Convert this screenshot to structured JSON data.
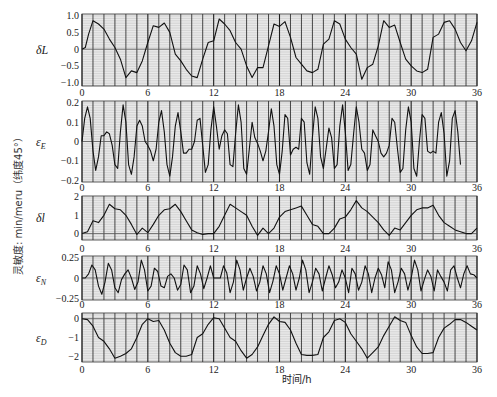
{
  "figure": {
    "x_axis_label": "时间/h",
    "side_label": "灵敏度: min/meru（纬度45°）",
    "colors": {
      "background": "#ffffff",
      "plot_bg": "#e9e9e9",
      "hgrid": "#c4c4c4",
      "vgrid": "#1e1e1e",
      "line": "#111111",
      "frame": "#333333"
    }
  },
  "chart_data": [
    {
      "id": "dL",
      "type": "line",
      "ylabel": "δL",
      "ylabel_sub": "",
      "xlim": [
        0,
        36
      ],
      "ylim": [
        -1.1,
        1.05
      ],
      "yticks": [
        1.0,
        0.5,
        0,
        -0.5,
        -1.0
      ],
      "ytick_labels": [
        "1.0",
        "0.5",
        "0",
        "-0.5",
        "-1.0"
      ],
      "xticks": [
        0,
        6,
        12,
        18,
        24,
        30,
        36
      ],
      "xtick_labels": [
        "0",
        "6",
        "12",
        "18",
        "24",
        "30",
        "36"
      ],
      "x": [
        0,
        0.3,
        0.6,
        1.0,
        1.5,
        2.0,
        2.5,
        3.0,
        3.5,
        4.0,
        4.5,
        5.0,
        5.5,
        6.0,
        6.5,
        7.0,
        7.5,
        8.0,
        8.5,
        9.0,
        9.5,
        10.0,
        10.5,
        11.0,
        11.5,
        12.0,
        12.5,
        13.0,
        13.5,
        14.0,
        14.5,
        15.0,
        15.5,
        16.0,
        16.5,
        17.0,
        17.5,
        18.0,
        18.5,
        19.0,
        19.5,
        20.0,
        20.5,
        21.0,
        21.5,
        22.0,
        22.5,
        23.0,
        23.5,
        24.0,
        24.5,
        25.0,
        25.5,
        26.0,
        26.5,
        27.0,
        27.5,
        28.0,
        28.5,
        29.0,
        29.5,
        30.0,
        30.5,
        31.0,
        31.5,
        32.0,
        32.5,
        33.0,
        33.5,
        34.0,
        34.5,
        35.0,
        35.5,
        36.0
      ],
      "y": [
        0,
        0.05,
        0.45,
        0.85,
        0.75,
        0.6,
        0.3,
        0.05,
        -0.3,
        -0.85,
        -0.65,
        -0.7,
        -0.35,
        0.2,
        0.7,
        0.65,
        0.78,
        0.5,
        -0.15,
        -0.35,
        -0.6,
        -0.8,
        -0.85,
        -0.3,
        0.2,
        0.25,
        0.9,
        0.75,
        0.55,
        0.2,
        0.0,
        -0.5,
        -0.85,
        -0.55,
        -0.55,
        0.1,
        0.75,
        0.68,
        0.82,
        0.35,
        -0.25,
        -0.45,
        -0.65,
        -0.7,
        -0.6,
        0.15,
        0.3,
        0.85,
        0.75,
        0.3,
        0.05,
        -0.15,
        -0.9,
        -0.55,
        -0.45,
        0.1,
        0.85,
        0.65,
        0.72,
        0.2,
        -0.3,
        -0.5,
        -0.65,
        -0.7,
        -0.6,
        0.35,
        0.45,
        0.8,
        0.85,
        0.6,
        0.2,
        -0.05,
        0.25,
        0.8
      ]
    },
    {
      "id": "eE",
      "type": "line",
      "ylabel": "ε",
      "ylabel_sub": "E",
      "xlim": [
        0,
        36
      ],
      "ylim": [
        -0.21,
        0.21
      ],
      "yticks": [
        0.2,
        0.1,
        0,
        -0.1,
        -0.2
      ],
      "ytick_labels": [
        "0.2",
        "0.1",
        "0",
        "-0.1",
        "-0.2"
      ],
      "xticks": [
        0,
        6,
        12,
        18,
        24,
        30,
        36
      ],
      "xtick_labels": [
        "0",
        "6",
        "12",
        "18",
        "24",
        "30",
        "36"
      ],
      "x": [
        0,
        0.25,
        0.5,
        0.75,
        1.0,
        1.25,
        1.5,
        1.75,
        2.0,
        2.25,
        2.5,
        2.75,
        3.0,
        3.25,
        3.5,
        3.75,
        4.0,
        4.25,
        4.5,
        4.75,
        5.0,
        5.25,
        5.5,
        5.75,
        6.0,
        6.25,
        6.5,
        6.75,
        7.0,
        7.25,
        7.5,
        7.75,
        8.0,
        8.25,
        8.5,
        8.75,
        9.0,
        9.25,
        9.5,
        9.75,
        10.0,
        10.25,
        10.5,
        10.75,
        11.0,
        11.25,
        11.5,
        11.75,
        12.0,
        12.25,
        12.5,
        12.75,
        13.0,
        13.25,
        13.5,
        13.75,
        14.0,
        14.25,
        14.5,
        14.75,
        15.0,
        15.25,
        15.5,
        15.75,
        16.0,
        16.25,
        16.5,
        16.75,
        17.0,
        17.25,
        17.5,
        17.75,
        18.0,
        18.25,
        18.5,
        18.75,
        19.0,
        19.25,
        19.5,
        19.75,
        20.0,
        20.25,
        20.5,
        20.75,
        21.0,
        21.25,
        21.5,
        21.75,
        22.0,
        22.25,
        22.5,
        22.75,
        23.0,
        23.25,
        23.5,
        23.75,
        24.0,
        24.25,
        24.5,
        24.75,
        25.0,
        25.25,
        25.5,
        25.75,
        26.0,
        26.25,
        26.5,
        26.75,
        27.0,
        27.25,
        27.5,
        27.75,
        28.0,
        28.25,
        28.5,
        28.75,
        29.0,
        29.25,
        29.5,
        29.75,
        30.0,
        30.25,
        30.5,
        30.75,
        31.0,
        31.25,
        31.5,
        31.75,
        32.0,
        32.25,
        32.5,
        32.75,
        33.0,
        33.25,
        33.5,
        33.75,
        34.0,
        34.25,
        34.5,
        34.75,
        35.0,
        35.25,
        35.5,
        35.75,
        36.0
      ],
      "y": [
        0,
        0.12,
        0.18,
        0.12,
        -0.05,
        -0.15,
        -0.08,
        0.03,
        0.03,
        0.05,
        0.04,
        -0.02,
        -0.12,
        -0.14,
        0.05,
        0.19,
        0.1,
        -0.12,
        -0.17,
        -0.08,
        0.08,
        0.11,
        0.08,
        0.0,
        -0.02,
        -0.05,
        -0.1,
        -0.04,
        0.1,
        0.16,
        0.05,
        -0.12,
        -0.18,
        -0.08,
        0.08,
        0.15,
        0.05,
        -0.06,
        -0.06,
        -0.04,
        -0.04,
        0.0,
        0.11,
        0.12,
        -0.02,
        -0.16,
        -0.12,
        0.06,
        0.18,
        0.08,
        -0.04,
        0.03,
        0.06,
        0.04,
        -0.12,
        -0.13,
        0.04,
        0.19,
        0.1,
        -0.14,
        -0.17,
        -0.04,
        0.1,
        0.02,
        -0.01,
        -0.05,
        -0.1,
        -0.05,
        0.05,
        0.17,
        0.08,
        -0.12,
        -0.17,
        -0.05,
        0.14,
        0.12,
        -0.07,
        -0.04,
        -0.03,
        -0.04,
        0.12,
        0.1,
        -0.11,
        -0.17,
        0.02,
        0.18,
        0.12,
        -0.08,
        -0.14,
        -0.04,
        0.07,
        0.02,
        -0.14,
        -0.12,
        0.08,
        0.19,
        0.05,
        -0.15,
        -0.12,
        0.04,
        0.18,
        0.1,
        -0.04,
        -0.06,
        -0.15,
        -0.12,
        0.06,
        0.03,
        0.0,
        -0.06,
        -0.08,
        -0.06,
        -0.02,
        0.12,
        0.1,
        -0.04,
        -0.16,
        -0.14,
        0.06,
        0.18,
        0.1,
        -0.14,
        -0.18,
        0.0,
        0.14,
        0.12,
        -0.05,
        -0.06,
        -0.05,
        -0.06,
        0.1,
        0.15,
        0.04,
        -0.18,
        -0.1,
        0.12,
        0.16,
        0.05,
        -0.12
      ]
    },
    {
      "id": "dl",
      "type": "line",
      "ylabel": "δl",
      "ylabel_sub": "",
      "xlim": [
        0,
        36
      ],
      "ylim": [
        -0.35,
        2.05
      ],
      "yticks": [
        2,
        1,
        0
      ],
      "ytick_labels": [
        "2",
        "1",
        "0"
      ],
      "xticks": [
        0,
        6,
        12,
        18,
        24,
        30,
        36
      ],
      "xtick_labels": [
        "0",
        "6",
        "12",
        "18",
        "24",
        "30",
        "36"
      ],
      "x": [
        0,
        0.5,
        1.0,
        1.5,
        2.0,
        2.5,
        3.0,
        3.5,
        4.0,
        4.5,
        5.0,
        5.5,
        6.0,
        6.5,
        7.0,
        7.5,
        8.0,
        8.5,
        9.0,
        9.5,
        10.0,
        10.5,
        11.0,
        11.5,
        12.0,
        12.5,
        13.0,
        13.5,
        14.0,
        14.5,
        15.0,
        15.5,
        16.0,
        16.5,
        17.0,
        17.5,
        18.0,
        18.5,
        19.0,
        19.5,
        20.0,
        20.5,
        21.0,
        21.5,
        22.0,
        22.5,
        23.0,
        23.5,
        24.0,
        24.5,
        25.0,
        25.5,
        26.0,
        26.5,
        27.0,
        27.5,
        28.0,
        28.5,
        29.0,
        29.5,
        30.0,
        30.5,
        31.0,
        31.5,
        32.0,
        32.5,
        33.0,
        33.5,
        34.0,
        34.5,
        35.0,
        35.5,
        36.0
      ],
      "y": [
        0,
        0.1,
        0.7,
        0.6,
        1.0,
        1.6,
        1.35,
        1.3,
        1.0,
        0.5,
        -0.05,
        0.3,
        0.05,
        0.5,
        1.0,
        1.3,
        1.35,
        1.6,
        1.2,
        0.7,
        0.2,
        0.05,
        -0.05,
        0.0,
        0.0,
        0.4,
        1.0,
        1.6,
        1.4,
        1.2,
        1.0,
        0.4,
        -0.1,
        0.3,
        0.0,
        0.3,
        0.9,
        1.2,
        1.3,
        1.4,
        1.5,
        1.0,
        0.5,
        0.4,
        0.0,
        0.0,
        0.3,
        0.8,
        0.9,
        1.3,
        1.8,
        1.4,
        1.2,
        0.9,
        0.6,
        0.2,
        -0.1,
        0.3,
        0.2,
        0.6,
        1.0,
        1.3,
        1.4,
        1.4,
        1.55,
        1.0,
        0.6,
        0.4,
        0.2,
        0.1,
        0.0,
        0.0,
        0.3
      ]
    },
    {
      "id": "eN",
      "type": "line",
      "ylabel": "ε",
      "ylabel_sub": "N",
      "xlim": [
        0,
        36
      ],
      "ylim": [
        -0.27,
        0.27
      ],
      "yticks": [
        0.25,
        0,
        -0.25
      ],
      "ytick_labels": [
        "0.25",
        "0",
        "-0.25"
      ],
      "xticks": [
        0,
        6,
        12,
        18,
        24,
        30,
        36
      ],
      "xtick_labels": [
        "0",
        "6",
        "12",
        "18",
        "24",
        "30",
        "36"
      ],
      "x": [
        0,
        0.3,
        0.6,
        0.9,
        1.2,
        1.5,
        1.8,
        2.1,
        2.4,
        2.7,
        3.0,
        3.3,
        3.6,
        3.9,
        4.2,
        4.5,
        4.8,
        5.1,
        5.4,
        5.7,
        6.0,
        6.3,
        6.6,
        6.9,
        7.2,
        7.5,
        7.8,
        8.1,
        8.4,
        8.7,
        9.0,
        9.3,
        9.6,
        9.9,
        10.2,
        10.5,
        10.8,
        11.1,
        11.4,
        11.7,
        12.0,
        12.3,
        12.6,
        12.9,
        13.2,
        13.5,
        13.8,
        14.1,
        14.4,
        14.7,
        15.0,
        15.3,
        15.6,
        15.9,
        16.2,
        16.5,
        16.8,
        17.1,
        17.4,
        17.7,
        18.0,
        18.3,
        18.6,
        18.9,
        19.2,
        19.5,
        19.8,
        20.1,
        20.4,
        20.7,
        21.0,
        21.3,
        21.6,
        21.9,
        22.2,
        22.5,
        22.8,
        23.1,
        23.4,
        23.7,
        24.0,
        24.3,
        24.6,
        24.9,
        25.2,
        25.5,
        25.8,
        26.1,
        26.4,
        26.7,
        27.0,
        27.3,
        27.6,
        27.9,
        28.2,
        28.5,
        28.8,
        29.1,
        29.4,
        29.7,
        30.0,
        30.3,
        30.6,
        30.9,
        31.2,
        31.5,
        31.8,
        32.1,
        32.4,
        32.7,
        33.0,
        33.3,
        33.6,
        33.9,
        34.2,
        34.5,
        34.8,
        35.1,
        35.4,
        35.7,
        36.0
      ],
      "y": [
        0,
        0.0,
        0.05,
        0.16,
        0.1,
        -0.1,
        -0.2,
        -0.05,
        0.18,
        0.1,
        -0.12,
        -0.18,
        -0.02,
        0.05,
        0.1,
        0.0,
        -0.14,
        -0.05,
        0.22,
        0.1,
        -0.16,
        -0.1,
        0.12,
        0.08,
        -0.1,
        -0.12,
        0.02,
        0.05,
        0.0,
        -0.15,
        -0.08,
        0.16,
        0.1,
        -0.18,
        -0.1,
        0.15,
        0.05,
        -0.13,
        0.0,
        0.15,
        0.0,
        0.0,
        0.0,
        0.15,
        0.06,
        -0.18,
        -0.05,
        0.22,
        0.1,
        -0.15,
        0.0,
        0.12,
        0.02,
        -0.16,
        -0.05,
        0.15,
        0.05,
        -0.18,
        -0.04,
        0.15,
        0.05,
        -0.15,
        0.0,
        0.15,
        0.05,
        -0.15,
        0.0,
        0.22,
        0.1,
        -0.18,
        -0.05,
        0.12,
        0.05,
        -0.16,
        0.0,
        0.15,
        0.04,
        -0.12,
        -0.05,
        0.1,
        0.0,
        -0.18,
        0.12,
        0.05,
        -0.15,
        -0.05,
        0.15,
        0.05,
        -0.18,
        0.0,
        0.12,
        0.04,
        -0.12,
        0.2,
        0.1,
        -0.18,
        -0.05,
        0.12,
        0.05,
        -0.15,
        0.0,
        0.22,
        0.1,
        -0.16,
        -0.02,
        0.1,
        0.02,
        -0.16,
        0.1,
        0.02,
        -0.05,
        -0.16,
        0.1,
        0.15,
        0.0,
        -0.12,
        0.05,
        0.15,
        0.05,
        0.04,
        0.0
      ]
    },
    {
      "id": "eD",
      "type": "line",
      "ylabel": "ε",
      "ylabel_sub": "D",
      "xlim": [
        0,
        36
      ],
      "ylim": [
        -2.3,
        0.3
      ],
      "yticks": [
        0,
        -1,
        -2
      ],
      "ytick_labels": [
        "0",
        "-1",
        "-2"
      ],
      "xticks": [
        0,
        6,
        12,
        18,
        24,
        30,
        36
      ],
      "xtick_labels": [
        "0",
        "6",
        "12",
        "18",
        "24",
        "30",
        "36"
      ],
      "x": [
        0,
        0.5,
        1.0,
        1.5,
        2.0,
        2.5,
        3.0,
        3.5,
        4.0,
        4.5,
        5.0,
        5.5,
        6.0,
        6.5,
        7.0,
        7.5,
        8.0,
        8.5,
        9.0,
        9.5,
        10.0,
        10.5,
        11.0,
        11.5,
        12.0,
        12.5,
        13.0,
        13.5,
        14.0,
        14.5,
        15.0,
        15.5,
        16.0,
        16.5,
        17.0,
        17.5,
        18.0,
        18.5,
        19.0,
        19.5,
        20.0,
        20.5,
        21.0,
        21.5,
        22.0,
        22.5,
        23.0,
        23.5,
        24.0,
        24.5,
        25.0,
        25.5,
        26.0,
        26.5,
        27.0,
        27.5,
        28.0,
        28.5,
        29.0,
        29.5,
        30.0,
        30.5,
        31.0,
        31.5,
        32.0,
        32.5,
        33.0,
        33.5,
        34.0,
        34.5,
        35.0,
        35.5,
        36.0
      ],
      "y": [
        0,
        -0.05,
        -0.4,
        -1.0,
        -1.2,
        -1.6,
        -2.1,
        -2.0,
        -1.85,
        -1.6,
        -1.0,
        -0.3,
        0.0,
        -0.15,
        -0.1,
        -0.6,
        -1.3,
        -1.8,
        -2.0,
        -2.0,
        -1.9,
        -1.0,
        -0.8,
        -0.3,
        0.05,
        0.0,
        -0.5,
        -1.0,
        -1.2,
        -1.7,
        -2.1,
        -1.9,
        -1.5,
        -0.9,
        -0.3,
        0.1,
        -0.15,
        -0.2,
        -0.6,
        -1.3,
        -1.9,
        -1.95,
        -1.95,
        -1.9,
        -1.0,
        -0.7,
        -0.1,
        0.0,
        -0.2,
        -0.8,
        -1.2,
        -1.6,
        -2.1,
        -1.8,
        -1.5,
        -0.9,
        -0.4,
        0.1,
        -0.1,
        -0.2,
        -0.9,
        -1.5,
        -1.85,
        -1.85,
        -1.8,
        -1.0,
        -0.5,
        -0.3,
        -0.05,
        -0.05,
        -0.2,
        -0.4,
        -0.6
      ]
    }
  ]
}
